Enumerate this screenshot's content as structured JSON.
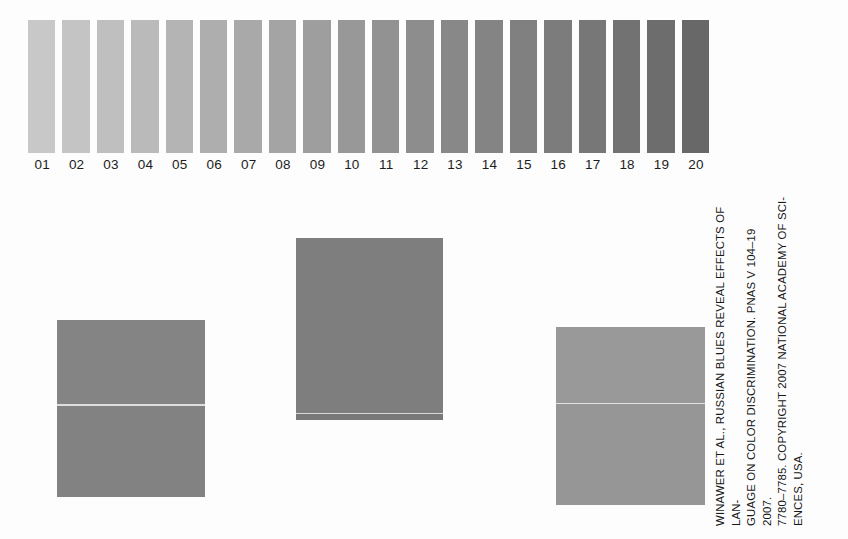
{
  "figure": {
    "background": "#fdfdfd"
  },
  "caption": {
    "text": "WINAWER ET AL., RUSSIAN BLUES REVEAL EFFECTS OF LAN-\nGUAGE ON COLOR DISCRIMINATION. PNAS V 104–19 2007.\n7780–7785. COPYRIGHT 2007 NATIONAL ACADEMY OF SCI-\nENCES, USA.",
    "rotation": "-90deg",
    "color": "#161616"
  },
  "chart_data": {
    "type": "bar",
    "xlabel": "",
    "ylabel": "",
    "categories": [
      "01",
      "02",
      "03",
      "04",
      "05",
      "06",
      "07",
      "08",
      "09",
      "10",
      "11",
      "12",
      "13",
      "14",
      "15",
      "16",
      "17",
      "18",
      "19",
      "20"
    ],
    "values": [
      1,
      2,
      3,
      4,
      5,
      6,
      7,
      8,
      9,
      10,
      11,
      12,
      13,
      14,
      15,
      16,
      17,
      18,
      19,
      20
    ],
    "colors": [
      "#c8c8c8",
      "#c4c4c4",
      "#bfbfbf",
      "#bababa",
      "#b4b4b4",
      "#aeaeae",
      "#a9a9a9",
      "#a4a4a4",
      "#9e9e9e",
      "#989898",
      "#929292",
      "#8d8d8d",
      "#888888",
      "#848484",
      "#808080",
      "#7c7c7c",
      "#777777",
      "#727272",
      "#6d6d6d",
      "#686868"
    ],
    "grid": false,
    "legend_position": "none"
  },
  "squares": [
    {
      "id": "square-left",
      "name": "left-comparison-square",
      "top_color": "#848484",
      "bottom_color": "#828282",
      "divider_color": "#dedede",
      "divider_offset_pct": 48,
      "has_bottom_strip": false
    },
    {
      "id": "square-mid",
      "name": "center-comparison-square",
      "top_color": "#7e7e7e",
      "bottom_color": "#7e7e7e",
      "divider_color": "#d9d9d9",
      "divider_offset_pct": 100,
      "has_bottom_strip": true,
      "strip_color": "#787878"
    },
    {
      "id": "square-right",
      "name": "right-comparison-square",
      "top_color": "#999999",
      "bottom_color": "#969696",
      "divider_color": "#e2e2e2",
      "divider_offset_pct": 43,
      "has_bottom_strip": false
    }
  ]
}
